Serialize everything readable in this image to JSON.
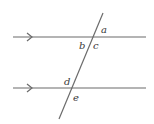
{
  "diagram": {
    "colors": {
      "line": "#6b6b6b",
      "label": "#3a3a3a",
      "background": "#ffffff"
    },
    "parallel_lines": [
      {
        "id": "top-line",
        "x1": 13,
        "y1": 37,
        "x2": 146,
        "y2": 37,
        "arrow_x": 31
      },
      {
        "id": "bottom-line",
        "x1": 13,
        "y1": 88,
        "x2": 146,
        "y2": 88,
        "arrow_x": 31
      }
    ],
    "transversal": {
      "x1": 103,
      "y1": 13,
      "x2": 59,
      "y2": 119
    },
    "angle_labels": [
      {
        "text": "a",
        "x": 101,
        "y": 33
      },
      {
        "text": "b",
        "x": 79,
        "y": 49
      },
      {
        "text": "c",
        "x": 93,
        "y": 49
      },
      {
        "text": "d",
        "x": 64,
        "y": 85
      },
      {
        "text": "e",
        "x": 73,
        "y": 101
      }
    ]
  }
}
